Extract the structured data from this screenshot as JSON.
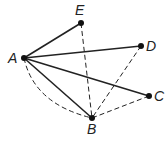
{
  "diagram": {
    "points": {
      "A": {
        "label": "A",
        "x": 24,
        "y": 58,
        "lx": 8,
        "ly": 63
      },
      "E": {
        "label": "E",
        "x": 81,
        "y": 23,
        "lx": 75,
        "ly": 15
      },
      "D": {
        "label": "D",
        "x": 141,
        "y": 46,
        "lx": 146,
        "ly": 51
      },
      "C": {
        "label": "C",
        "x": 149,
        "y": 96,
        "lx": 154,
        "ly": 101
      },
      "B": {
        "label": "B",
        "x": 92,
        "y": 118,
        "lx": 87,
        "ly": 134
      }
    },
    "solid_segments": [
      [
        "A",
        "E"
      ],
      [
        "A",
        "D"
      ],
      [
        "A",
        "C"
      ],
      [
        "A",
        "B"
      ]
    ],
    "dashed_segments": [
      [
        "E",
        "B"
      ],
      [
        "D",
        "B"
      ],
      [
        "C",
        "B"
      ]
    ],
    "dashed_arcs": [
      [
        "A",
        "B"
      ]
    ],
    "colors": {
      "stroke": "#222222",
      "point": "#111111"
    }
  }
}
